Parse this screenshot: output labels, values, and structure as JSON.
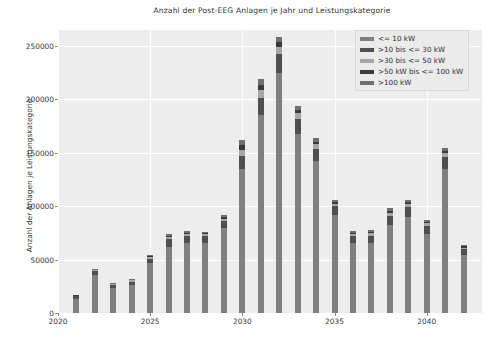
{
  "chart_data": {
    "type": "bar",
    "title": "Anzahl der Post-EEG Anlagen je Jahr und Leistungskategorie",
    "xlabel": "",
    "ylabel": "Anzahl der Anlagen je Leistungskategorie",
    "stacked": true,
    "grid": true,
    "legend_position": "upper right",
    "ylim": [
      0,
      265000
    ],
    "xlim": [
      2020,
      2043
    ],
    "yticks": [
      0,
      50000,
      100000,
      150000,
      200000,
      250000
    ],
    "ytick_labels": [
      "0",
      "50000",
      "100000",
      "150000",
      "200000",
      "250000"
    ],
    "xticks": [
      2020,
      2025,
      2030,
      2035,
      2040
    ],
    "xtick_labels": [
      "2020",
      "2025",
      "2030",
      "2035",
      "2040"
    ],
    "categories": [
      2021,
      2022,
      2023,
      2024,
      2025,
      2026,
      2027,
      2028,
      2029,
      2030,
      2031,
      2032,
      2033,
      2034,
      2035,
      2036,
      2037,
      2038,
      2039,
      2040,
      2041,
      2042
    ],
    "series": [
      {
        "name": "<= 10 kW",
        "color": "#808080",
        "values": [
          13000,
          36000,
          23000,
          26000,
          47000,
          62000,
          66000,
          66000,
          80000,
          135000,
          185000,
          225000,
          168000,
          142000,
          92000,
          66000,
          66000,
          82000,
          90000,
          74000,
          135000,
          54000
        ]
      },
      {
        "name": ">10 bis <= 30 kW",
        "color": "#4f4f4f",
        "values": [
          2500,
          3000,
          3000,
          3500,
          4000,
          7000,
          6500,
          6000,
          6500,
          12000,
          16000,
          18000,
          14000,
          12000,
          8000,
          6000,
          6500,
          9000,
          9000,
          7500,
          11000,
          5500
        ]
      },
      {
        "name": ">30 bis <= 50 kW",
        "color": "#a6a6a6",
        "values": [
          600,
          900,
          900,
          1000,
          1200,
          2000,
          1800,
          1700,
          2000,
          6000,
          8000,
          6500,
          5000,
          4000,
          2500,
          2000,
          2200,
          3000,
          3000,
          2500,
          3500,
          1800
        ]
      },
      {
        "name": ">50 kW bis <= 100 kW",
        "color": "#3a3a3a",
        "values": [
          400,
          600,
          600,
          700,
          800,
          1200,
          1100,
          1000,
          1300,
          4000,
          5000,
          4000,
          3000,
          2500,
          1600,
          1300,
          1400,
          1900,
          1900,
          1600,
          2300,
          1200
        ]
      },
      {
        "name": ">100 kW",
        "color": "#6f6f6f",
        "values": [
          500,
          700,
          700,
          800,
          1000,
          1500,
          1400,
          1300,
          1700,
          5000,
          5500,
          5000,
          3800,
          3000,
          2000,
          1600,
          1800,
          2400,
          2400,
          2000,
          3000,
          1500
        ]
      }
    ]
  },
  "legend": {
    "items": [
      {
        "label": "<= 10 kW"
      },
      {
        "label": ">10 bis <= 30 kW"
      },
      {
        "label": ">30 bis <= 50 kW"
      },
      {
        "label": ">50 kW bis <= 100 kW"
      },
      {
        "label": ">100 kW"
      }
    ]
  }
}
